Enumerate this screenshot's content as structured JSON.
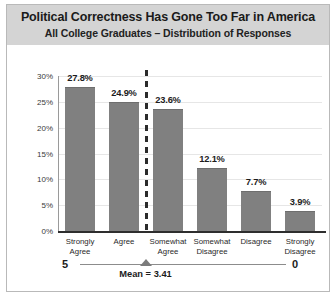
{
  "chart_data": {
    "type": "bar",
    "title": "Political Correctness Has Gone Too Far in America",
    "subtitle": "All College Graduates – Distribution of Responses",
    "categories": [
      "Strongly\nAgree",
      "Agree",
      "Somewhat\nAgree",
      "Somewhat\nDisagree",
      "Disagree",
      "Strongly\nDisagree"
    ],
    "values": [
      27.8,
      24.9,
      23.6,
      12.1,
      7.7,
      3.9
    ],
    "value_labels": [
      "27.8%",
      "24.9%",
      "23.6%",
      "12.1%",
      "7.7%",
      "3.9%"
    ],
    "xlabel": "",
    "ylabel": "",
    "ylim": [
      0,
      30
    ],
    "ytick_values": [
      0,
      5,
      10,
      15,
      20,
      25,
      30
    ],
    "ytick_labels": [
      "0%",
      "5%",
      "10%",
      "15%",
      "20%",
      "25%",
      "30%"
    ],
    "grid": "horizontal",
    "legend": "none",
    "bar_color": "#808080",
    "header_band_color": "#d4d4d4",
    "annotations": {
      "divider": {
        "style": "dashed-vertical",
        "between": [
          "Agree",
          "Somewhat Agree"
        ],
        "color": "#2b2b2b"
      },
      "mean_scale": {
        "left_label": "5",
        "right_label": "0",
        "mean_label": "Mean = 3.41",
        "mean_value": 3.41,
        "scale_min": 0,
        "scale_max": 5,
        "marker": "triangle-up",
        "marker_color": "#7b7b7b"
      }
    }
  }
}
